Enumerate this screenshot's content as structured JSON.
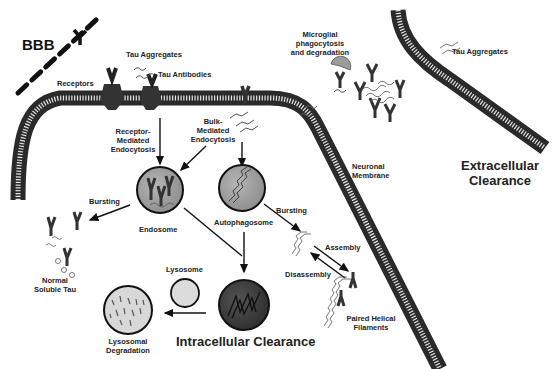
{
  "figure": {
    "title_left": "BBB",
    "labels": {
      "receptors": "Receptors",
      "tau_aggregates_top": "Tau Aggregates",
      "tau_antibodies": "Tau Antibodies",
      "microglial": "Microglial phagocytosis and degradation",
      "microglial_line1": "Microglial",
      "microglial_line2": "phagocytosis",
      "microglial_line3": "and degradation",
      "tau_aggregates_right": "Tau Aggregates",
      "receptor_mediated_1": "Receptor-",
      "receptor_mediated_2": "Mediated",
      "receptor_mediated_3": "Endocytosis",
      "bulk_mediated_1": "Bulk-",
      "bulk_mediated_2": "Mediated",
      "bulk_mediated_3": "Endocytosis",
      "neuronal_membrane_1": "Neuronal",
      "neuronal_membrane_2": "Membrane",
      "extracellular_1": "Extracellular",
      "extracellular_2": "Clearance",
      "bursting_left": "Bursting",
      "endosome": "Endosome",
      "autophagosome": "Autophagosome",
      "bursting_right": "Bursting",
      "assembly": "Assembly",
      "disassembly": "Disassembly",
      "normal_soluble_1": "Normal",
      "normal_soluble_2": "Soluble Tau",
      "lysosome": "Lysosome",
      "lysosomal_1": "Lysosomal",
      "lysosomal_2": "Degradation",
      "intracellular": "Intracellular Clearance",
      "phf_1": "Paired Helical",
      "phf_2": "Filaments"
    },
    "colors": {
      "endosome_fill": "#9a9a9a",
      "autophagosome_fill": "#8c8c8c",
      "autolysosome_fill": "#3a3a3a",
      "lysosome_fill": "#dcdcdc",
      "lysosomal_degradation_fill": "#d8d8d8",
      "microglia_fill": "#9c9c9c",
      "membrane": "#333333"
    }
  }
}
